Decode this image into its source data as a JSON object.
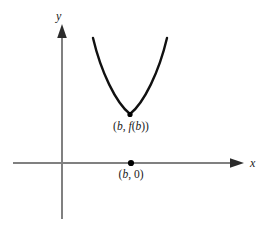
{
  "figure": {
    "title": "",
    "background_color": "#ffffff",
    "axis_color": "#808080",
    "curve_color": "#111111",
    "point_color": "#000000",
    "text_color": "#1a1a1a"
  },
  "axes": {
    "y_label": "y",
    "x_label": "x",
    "origin": {
      "x": 62,
      "y": 163
    },
    "x_axis": {
      "start_x": 13,
      "end_x": 243,
      "y": 163,
      "arrow": "right"
    },
    "y_axis": {
      "x": 62,
      "start_y": 219,
      "end_y": 25,
      "arrow": "up"
    }
  },
  "labels": {
    "vertex": {
      "prefix": "(",
      "var1": "b",
      "sep": ", ",
      "func": "f",
      "open": "(",
      "var2": "b",
      "close": "))",
      "full_text": "(b, f(b))"
    },
    "root": {
      "prefix": "(",
      "var1": "b",
      "sep": ", ",
      "value": "0",
      "close": ")",
      "full_text": "(b, 0)"
    }
  },
  "chart_data": {
    "type": "line",
    "title": "",
    "xlabel": "x",
    "ylabel": "y",
    "grid": false,
    "legend": null,
    "annotations": [
      {
        "text": "(b, f(b))",
        "point": [
          130,
          114
        ],
        "position": "below"
      },
      {
        "text": "(b, 0)",
        "point": [
          131,
          163
        ],
        "position": "below"
      }
    ],
    "points": [
      {
        "name": "vertex",
        "label": "(b, f(b))",
        "px": 130,
        "py": 114
      },
      {
        "name": "x-intercept-marker",
        "label": "(b, 0)",
        "px": 131,
        "py": 163
      }
    ],
    "series": [
      {
        "name": "parabola",
        "description": "upward-opening parabola with vertex at (b, f(b)) lying entirely above the x-axis",
        "path_pixels": [
          [
            93,
            38
          ],
          [
            97,
            52
          ],
          [
            102,
            66
          ],
          [
            108,
            80
          ],
          [
            114,
            92
          ],
          [
            121,
            102
          ],
          [
            130,
            114
          ],
          [
            139,
            103
          ],
          [
            146,
            92
          ],
          [
            153,
            79
          ],
          [
            159,
            65
          ],
          [
            164,
            51
          ],
          [
            167,
            38
          ]
        ]
      }
    ],
    "xlim": [
      13,
      243
    ],
    "ylim": [
      219,
      25
    ]
  }
}
